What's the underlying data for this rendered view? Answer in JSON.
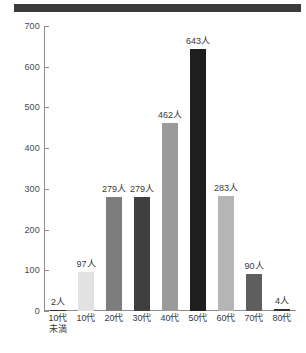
{
  "chart_data": {
    "type": "bar",
    "title": "",
    "subtitle": "",
    "xlabel": "",
    "ylabel": "",
    "ylim": [
      0,
      700
    ],
    "ytick_step": 100,
    "yticks": [
      "0",
      "100",
      "200",
      "300",
      "400",
      "500",
      "600",
      "700"
    ],
    "grid": false,
    "legend": null,
    "unit_suffix": "人",
    "categories": [
      "10代未満",
      "10代",
      "20代",
      "30代",
      "40代",
      "50代",
      "60代",
      "70代",
      "80代"
    ],
    "category_lines": [
      [
        "10代",
        "未満"
      ],
      [
        "10代",
        ""
      ],
      [
        "20代",
        ""
      ],
      [
        "30代",
        ""
      ],
      [
        "40代",
        ""
      ],
      [
        "50代",
        ""
      ],
      [
        "60代",
        ""
      ],
      [
        "70代",
        ""
      ],
      [
        "80代",
        ""
      ]
    ],
    "values": [
      2,
      97,
      279,
      279,
      462,
      643,
      283,
      90,
      4
    ],
    "data_labels": [
      "2人",
      "97人",
      "279人",
      "279人",
      "462人",
      "643人",
      "283人",
      "90人",
      "4人"
    ],
    "bar_colors": [
      "#2f2f2f",
      "#e2e2e2",
      "#7d7d7d",
      "#3f3f3f",
      "#9a9a9a",
      "#1e1e1e",
      "#b5b5b5",
      "#5e5e5e",
      "#2f2f2f"
    ]
  },
  "axis": {
    "line_color": "#8d8d8d",
    "text_color": "#3a3a3a"
  },
  "decor": {
    "top_band_color": "#3b3b3b"
  }
}
